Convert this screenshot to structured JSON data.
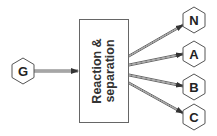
{
  "diagram": {
    "type": "process-flow",
    "colors": {
      "background": "#ffffff",
      "stroke": "#555555",
      "arrow": "#444444",
      "text": "#222222"
    },
    "input_node": {
      "label": "G",
      "shape": "hexagon",
      "cx": 23,
      "cy": 71
    },
    "process_box": {
      "label_line1": "Reaction &",
      "label_line2": "separation",
      "x": 79,
      "y": 19,
      "width": 49,
      "height": 103,
      "text_orientation": "rotated -90deg"
    },
    "output_nodes": [
      {
        "label": "N",
        "shape": "hexagon",
        "cx": 194,
        "cy": 20
      },
      {
        "label": "A",
        "shape": "hexagon",
        "cx": 194,
        "cy": 54
      },
      {
        "label": "B",
        "shape": "hexagon",
        "cx": 194,
        "cy": 87
      },
      {
        "label": "C",
        "shape": "hexagon",
        "cx": 194,
        "cy": 117
      }
    ],
    "edges": [
      {
        "from": "G",
        "to": "Reaction & separation",
        "style": "double-line arrow"
      },
      {
        "from": "Reaction & separation",
        "to": "N",
        "style": "double-line arrow"
      },
      {
        "from": "Reaction & separation",
        "to": "A",
        "style": "double-line arrow"
      },
      {
        "from": "Reaction & separation",
        "to": "B",
        "style": "double-line arrow"
      },
      {
        "from": "Reaction & separation",
        "to": "C",
        "style": "double-line arrow"
      }
    ]
  }
}
